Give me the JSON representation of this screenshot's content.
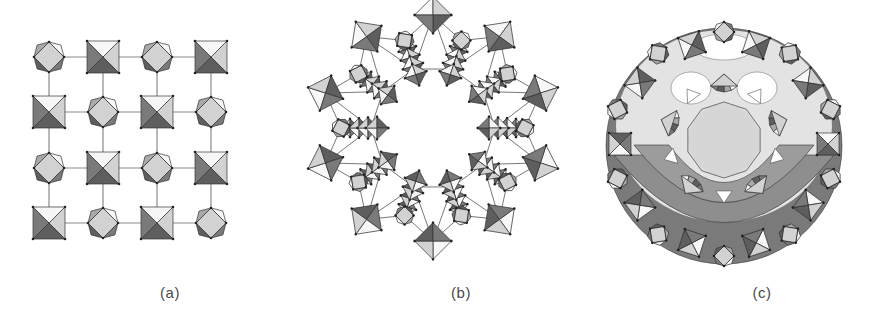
{
  "figure": {
    "panels": [
      {
        "id": "a",
        "label": "(a)",
        "description": "4x4 square grid of corner-linked octahedra, alternating orientation",
        "label_x": 170
      },
      {
        "id": "b",
        "label": "(b)",
        "description": "Wheel-shaped ring of octahedra around a star-shaped central cavity",
        "label_x": 461
      },
      {
        "id": "c",
        "label": "(c)",
        "description": "Spherical cluster of octahedra with pentagonal units and central circular window",
        "label_x": 762
      }
    ]
  },
  "palette": {
    "light": "#d2d2d2",
    "mid": "#a9a9a9",
    "dark": "#7a7a7a",
    "darker": "#5e5e5e",
    "white": "#f7f7f7",
    "edge": "#333333",
    "link": "#8a8a8a",
    "pale": "#e3e3e3",
    "band": "#8e8e8e"
  },
  "panel_a": {
    "cols": [
      49,
      103,
      157,
      211
    ],
    "rows": [
      57,
      112,
      168,
      223
    ],
    "size": 32
  },
  "panel_b": {
    "cx": 433,
    "cy": 128,
    "outer_count": 10,
    "outer_radius": 113,
    "inner_count": 10,
    "inner_radius": 62,
    "size": 18
  },
  "panel_c": {
    "cx": 724,
    "cy": 140,
    "window_r": 38,
    "ring1_count": 5,
    "ring1_radius": 66,
    "ring2_count": 10,
    "ring2_radius": 104,
    "size": 18
  }
}
